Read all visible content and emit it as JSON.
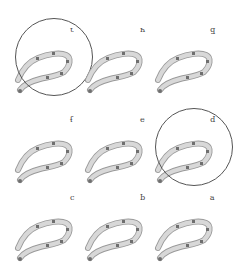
{
  "figure": {
    "orientation": "rotated-180",
    "panels": [
      {
        "id": "i",
        "label": "ɿ",
        "x": 8,
        "y": 22,
        "circled": true
      },
      {
        "id": "h",
        "label": "ч",
        "x": 78,
        "y": 22,
        "circled": false
      },
      {
        "id": "g",
        "label": "ƃ",
        "x": 148,
        "y": 22,
        "circled": false
      },
      {
        "id": "f",
        "label": "ɟ",
        "x": 8,
        "y": 112,
        "circled": false
      },
      {
        "id": "e",
        "label": "ǝ",
        "x": 78,
        "y": 112,
        "circled": false
      },
      {
        "id": "d",
        "label": "p",
        "x": 148,
        "y": 112,
        "circled": true
      },
      {
        "id": "c",
        "label": "ɔ",
        "x": 8,
        "y": 190,
        "circled": false
      },
      {
        "id": "b",
        "label": "q",
        "x": 78,
        "y": 190,
        "circled": false
      },
      {
        "id": "a",
        "label": "ɐ",
        "x": 148,
        "y": 190,
        "circled": false
      }
    ],
    "colors": {
      "body": "#d8d8d8",
      "outline": "#9a9a9a",
      "marker": "#6f6f6f",
      "ring": "#555555"
    }
  }
}
